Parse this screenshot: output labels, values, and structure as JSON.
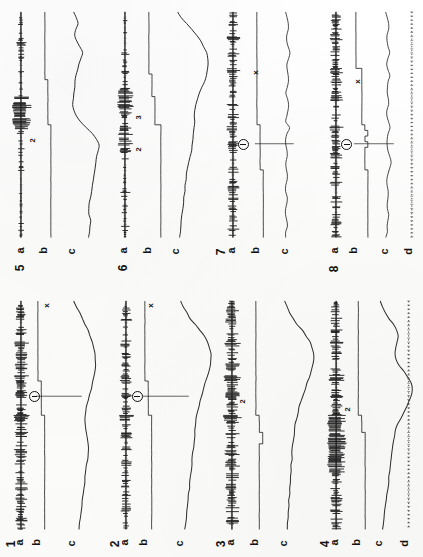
{
  "figure": {
    "orientation": "rotated-90",
    "background_color": "#fdfdfc",
    "ink_color": "#111111",
    "panel_count": 8,
    "grid": "4 columns x 2 rows"
  },
  "trace_labels": {
    "a": "a",
    "b": "b",
    "c": "c",
    "d": "d"
  },
  "panels": [
    {
      "number": "5",
      "position": "row1-col1",
      "traces": [
        "a",
        "b",
        "c"
      ],
      "step_labels": [
        "2"
      ],
      "markers": [],
      "has_d_trace": false
    },
    {
      "number": "6",
      "position": "row1-col2",
      "traces": [
        "a",
        "b",
        "c"
      ],
      "step_labels": [
        "3",
        "2"
      ],
      "markers": [],
      "has_d_trace": false
    },
    {
      "number": "7",
      "position": "row1-col3",
      "traces": [
        "a",
        "b",
        "c"
      ],
      "step_labels": [],
      "markers": [
        "x",
        "circled-minus"
      ],
      "has_d_trace": false
    },
    {
      "number": "8",
      "position": "row1-col4",
      "traces": [
        "a",
        "b",
        "c",
        "d"
      ],
      "step_labels": [],
      "markers": [
        "x",
        "circled-minus"
      ],
      "has_d_trace": true
    },
    {
      "number": "1",
      "position": "row2-col1",
      "traces": [
        "a",
        "b",
        "c"
      ],
      "step_labels": [],
      "markers": [
        "x",
        "circled-minus"
      ],
      "has_d_trace": false
    },
    {
      "number": "2",
      "position": "row2-col2",
      "traces": [
        "a",
        "b",
        "c"
      ],
      "step_labels": [],
      "markers": [
        "x",
        "circled-minus"
      ],
      "has_d_trace": false
    },
    {
      "number": "3",
      "position": "row2-col3",
      "traces": [
        "a",
        "b",
        "c"
      ],
      "step_labels": [
        "2"
      ],
      "markers": [],
      "has_d_trace": false
    },
    {
      "number": "4",
      "position": "row2-col4",
      "traces": [
        "a",
        "b",
        "c",
        "d"
      ],
      "step_labels": [
        "2"
      ],
      "markers": [],
      "has_d_trace": true
    }
  ],
  "chart_data": {
    "type": "line",
    "xlabel": "",
    "ylabel": "",
    "note": "Eight panels of simultaneous recordings printed sideways; trace a = spiky neurogram baseline, trace b = stepped stimulus/pressure level, trace c = slow smooth response, trace d = dotted time marker (panels 4 and 8 only).",
    "panel_series": {
      "5": {
        "a": [
          0,
          0,
          1,
          0,
          0,
          3,
          0,
          0,
          1,
          0,
          0,
          0,
          2,
          0,
          0,
          6,
          9,
          8,
          7,
          9,
          6,
          2,
          0,
          0,
          1,
          0,
          0,
          0,
          2,
          0,
          0,
          0,
          1,
          0,
          0,
          0,
          0,
          2,
          0,
          0
        ],
        "b": [
          4,
          4,
          4,
          4,
          4,
          4,
          4,
          4,
          4,
          4,
          4,
          4,
          5,
          5,
          5,
          5,
          5,
          5,
          5,
          5,
          6,
          6,
          6,
          6,
          6,
          6,
          6,
          6,
          6,
          6,
          6,
          6,
          6,
          6,
          6,
          6,
          6,
          6,
          6,
          6
        ],
        "c": [
          12,
          16,
          18,
          15,
          13,
          16,
          20,
          24,
          22,
          19,
          17,
          15,
          14,
          13,
          12,
          11,
          10,
          12,
          16,
          22,
          30,
          38,
          44,
          48,
          47,
          45,
          43,
          42,
          41,
          40,
          39,
          38,
          36,
          34,
          33,
          34,
          36,
          35,
          34,
          33
        ]
      },
      "6": {
        "a": [
          0,
          0,
          2,
          0,
          0,
          1,
          0,
          3,
          0,
          0,
          2,
          0,
          0,
          5,
          7,
          6,
          8,
          5,
          3,
          0,
          4,
          6,
          5,
          7,
          4,
          0,
          2,
          0,
          0,
          1,
          0,
          0,
          3,
          0,
          0,
          1,
          0,
          0,
          2,
          0
        ],
        "b": [
          2,
          2,
          2,
          2,
          2,
          2,
          2,
          2,
          2,
          2,
          2,
          3,
          3,
          3,
          3,
          4,
          4,
          4,
          4,
          4,
          6,
          6,
          6,
          6,
          6,
          6,
          6,
          6,
          6,
          6,
          6,
          6,
          6,
          6,
          6,
          6,
          6,
          6,
          6,
          6
        ],
        "c": [
          8,
          14,
          22,
          30,
          38,
          45,
          50,
          54,
          56,
          57,
          56,
          54,
          51,
          47,
          43,
          40,
          37,
          35,
          34,
          36,
          34,
          33,
          32,
          31,
          30,
          28,
          26,
          24,
          22,
          21,
          20,
          19,
          18,
          17,
          16,
          15,
          14,
          13,
          12,
          11
        ]
      },
      "7": {
        "a": [
          3,
          2,
          4,
          3,
          5,
          2,
          3,
          4,
          2,
          3,
          5,
          3,
          2,
          4,
          3,
          2,
          5,
          3,
          4,
          2,
          6,
          3,
          2,
          4,
          3,
          5,
          2,
          3,
          4,
          2,
          3,
          5,
          2,
          3,
          4,
          2,
          3,
          2,
          4,
          3
        ],
        "b": [
          3,
          3,
          3,
          3,
          3,
          3,
          3,
          3,
          3,
          3,
          3,
          3,
          3,
          3,
          3,
          3,
          3,
          3,
          3,
          3,
          4,
          4,
          4,
          4,
          4,
          4,
          4,
          4,
          5,
          5,
          5,
          5,
          5,
          5,
          5,
          5,
          5,
          5,
          5,
          5
        ],
        "c": [
          14,
          15,
          16,
          16,
          15,
          15,
          16,
          17,
          16,
          15,
          15,
          16,
          16,
          15,
          14,
          15,
          16,
          16,
          15,
          14,
          17,
          15,
          14,
          14,
          15,
          15,
          14,
          14,
          15,
          15,
          14,
          14,
          15,
          15,
          14,
          14,
          15,
          15,
          14,
          14
        ]
      },
      "8": {
        "a": [
          3,
          4,
          2,
          3,
          5,
          3,
          2,
          4,
          3,
          2,
          5,
          3,
          4,
          2,
          3,
          5,
          2,
          3,
          4,
          2,
          6,
          3,
          4,
          2,
          3,
          5,
          2,
          4,
          3,
          2,
          5,
          3,
          2,
          4,
          3,
          2,
          3,
          4,
          2,
          3
        ],
        "b": [
          2,
          2,
          2,
          2,
          2,
          2,
          2,
          2,
          2,
          2,
          4,
          4,
          4,
          4,
          4,
          4,
          4,
          4,
          4,
          4,
          5,
          6,
          5,
          6,
          5,
          5,
          5,
          5,
          6,
          6,
          6,
          6,
          6,
          6,
          6,
          6,
          6,
          6,
          6,
          6
        ],
        "c": [
          14,
          15,
          16,
          16,
          15,
          15,
          16,
          17,
          16,
          15,
          16,
          17,
          16,
          15,
          15,
          16,
          16,
          15,
          15,
          16,
          17,
          16,
          15,
          15,
          16,
          17,
          18,
          17,
          16,
          15,
          15,
          16,
          16,
          15,
          15,
          16,
          16,
          15,
          15,
          14
        ]
      },
      "1": {
        "a": [
          2,
          4,
          3,
          5,
          2,
          4,
          3,
          6,
          2,
          4,
          3,
          5,
          2,
          6,
          4,
          3,
          5,
          2,
          4,
          3,
          7,
          4,
          3,
          5,
          2,
          4,
          6,
          3,
          5,
          2,
          4,
          3,
          5,
          2,
          4,
          3,
          5,
          2,
          4,
          3
        ],
        "b": [
          3,
          3,
          3,
          3,
          3,
          3,
          3,
          3,
          3,
          3,
          3,
          3,
          3,
          3,
          4,
          4,
          4,
          4,
          4,
          4,
          5,
          5,
          5,
          5,
          5,
          5,
          5,
          5,
          5,
          5,
          5,
          5,
          5,
          5,
          5,
          5,
          5,
          5,
          5,
          5
        ],
        "c": [
          10,
          14,
          18,
          22,
          26,
          30,
          33,
          36,
          38,
          39,
          40,
          40,
          39,
          38,
          36,
          34,
          32,
          30,
          28,
          27,
          26,
          26,
          27,
          28,
          29,
          30,
          30,
          29,
          28,
          27,
          26,
          25,
          24,
          23,
          22,
          21,
          20,
          19,
          18,
          17
        ]
      },
      "2": {
        "a": [
          1,
          3,
          2,
          4,
          1,
          3,
          2,
          5,
          1,
          3,
          2,
          4,
          1,
          5,
          3,
          2,
          4,
          1,
          3,
          2,
          6,
          3,
          2,
          4,
          1,
          3,
          5,
          2,
          4,
          1,
          3,
          2,
          4,
          1,
          3,
          2,
          4,
          1,
          3,
          2
        ],
        "b": [
          3,
          3,
          3,
          3,
          3,
          3,
          3,
          3,
          3,
          3,
          3,
          3,
          3,
          3,
          4,
          4,
          4,
          4,
          4,
          4,
          5,
          5,
          5,
          5,
          5,
          5,
          5,
          5,
          5,
          5,
          5,
          5,
          5,
          5,
          5,
          5,
          5,
          5,
          5,
          5
        ],
        "c": [
          8,
          12,
          18,
          24,
          32,
          40,
          47,
          52,
          56,
          58,
          58,
          57,
          55,
          52,
          49,
          46,
          43,
          40,
          38,
          36,
          34,
          33,
          32,
          31,
          30,
          29,
          28,
          27,
          26,
          25,
          24,
          23,
          22,
          21,
          20,
          19,
          18,
          17,
          16,
          15
        ]
      },
      "3": {
        "a": [
          2,
          5,
          3,
          6,
          2,
          4,
          3,
          7,
          2,
          5,
          3,
          6,
          2,
          8,
          4,
          3,
          6,
          2,
          5,
          3,
          9,
          5,
          3,
          6,
          2,
          4,
          7,
          3,
          6,
          2,
          5,
          3,
          6,
          2,
          4,
          3,
          6,
          2,
          5,
          3
        ],
        "b": [
          3,
          3,
          3,
          3,
          3,
          3,
          3,
          3,
          3,
          3,
          3,
          3,
          3,
          3,
          3,
          3,
          3,
          3,
          3,
          3,
          4,
          4,
          4,
          5,
          5,
          4,
          4,
          4,
          4,
          4,
          4,
          4,
          4,
          4,
          4,
          4,
          4,
          4,
          4,
          4
        ],
        "c": [
          13,
          16,
          20,
          25,
          31,
          38,
          44,
          49,
          52,
          54,
          54,
          53,
          51,
          48,
          45,
          42,
          39,
          36,
          34,
          32,
          30,
          28,
          27,
          26,
          25,
          24,
          23,
          23,
          22,
          22,
          21,
          21,
          20,
          20,
          19,
          19,
          18,
          18,
          17,
          17
        ]
      },
      "4": {
        "a": [
          2,
          4,
          3,
          5,
          2,
          4,
          3,
          6,
          2,
          4,
          3,
          5,
          2,
          7,
          4,
          3,
          5,
          2,
          4,
          3,
          8,
          9,
          8,
          7,
          9,
          8,
          7,
          8,
          9,
          7,
          4,
          3,
          5,
          2,
          4,
          3,
          5,
          2,
          4,
          3
        ],
        "b": [
          3,
          3,
          3,
          3,
          3,
          3,
          3,
          3,
          3,
          3,
          3,
          3,
          3,
          3,
          3,
          3,
          3,
          3,
          3,
          3,
          4,
          4,
          4,
          5,
          5,
          5,
          5,
          5,
          5,
          5,
          5,
          5,
          5,
          5,
          5,
          5,
          5,
          5,
          5,
          5
        ],
        "c": [
          12,
          15,
          19,
          24,
          30,
          34,
          36,
          35,
          33,
          32,
          34,
          38,
          44,
          50,
          54,
          56,
          55,
          52,
          48,
          44,
          40,
          36,
          33,
          31,
          30,
          29,
          28,
          27,
          26,
          25,
          24,
          23,
          22,
          21,
          20,
          19,
          18,
          17,
          16,
          15
        ],
        "d": "dotted-time-marker"
      }
    }
  }
}
